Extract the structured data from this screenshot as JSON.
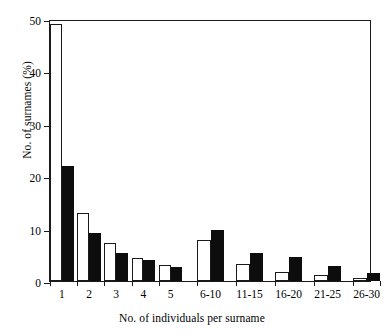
{
  "chart_data": {
    "type": "bar",
    "title": "",
    "xlabel": "No. of individuals per surname",
    "ylabel": "No. of surnames (%)",
    "categories": [
      "1",
      "2",
      "3",
      "4",
      "5",
      "6-10",
      "11-15",
      "16-20",
      "21-25",
      "26-30"
    ],
    "series": [
      {
        "name": "open",
        "fill": "#ffffff",
        "values": [
          49.0,
          13.0,
          7.2,
          4.3,
          3.1,
          7.8,
          3.3,
          1.8,
          1.2,
          0.6
        ]
      },
      {
        "name": "filled",
        "fill": "#0d0d0d",
        "values": [
          22.0,
          9.1,
          5.3,
          4.0,
          2.6,
          9.8,
          5.4,
          4.5,
          2.8,
          1.5
        ]
      }
    ],
    "ylim": [
      0,
      50
    ],
    "yticks": [
      0,
      10,
      20,
      30,
      40,
      50
    ],
    "ytick_labels": [
      "0",
      "10",
      "20",
      "30",
      "40",
      "50"
    ],
    "grid": false,
    "legend": "none",
    "frame": "box",
    "axis_color": "#1a1a1a"
  }
}
